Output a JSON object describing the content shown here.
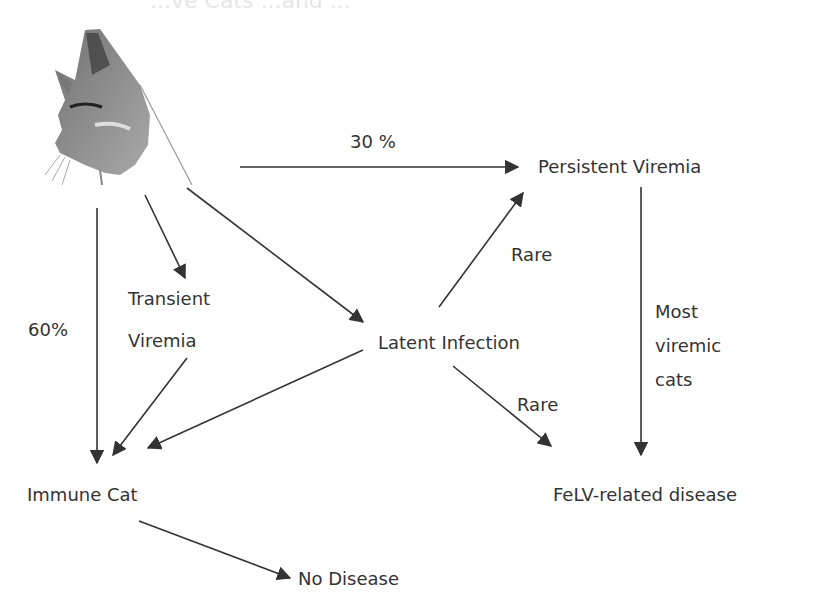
{
  "faded_header": "...ve Cats ...and ...",
  "nodes": {
    "persistent_viremia": "Persistent Viremia",
    "transient_line1": "Transient",
    "transient_line2": "Viremia",
    "latent_infection": "Latent Infection",
    "immune_cat": "Immune Cat",
    "felv_disease": "FeLV-related disease",
    "no_disease": "No Disease"
  },
  "edge_labels": {
    "pct30": "30 %",
    "pct60": "60%",
    "rare_up": "Rare",
    "rare_down": "Rare",
    "most_line1": "Most",
    "most_line2": "viremic",
    "most_line3": "cats"
  },
  "colors": {
    "line": "#333333",
    "text": "#2b2b2b"
  },
  "icon": "cat-head-sketch"
}
